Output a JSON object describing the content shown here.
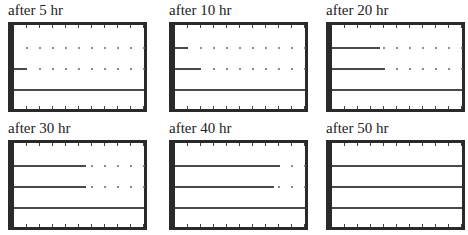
{
  "figure": {
    "grid": {
      "columns": 10,
      "rows": [
        0.27,
        0.52,
        0.77
      ]
    },
    "panels": [
      {
        "label": "after 5 hr",
        "x": 8,
        "y": 2,
        "lines": [
          0,
          1.0,
          10
        ]
      },
      {
        "label": "after 10 hr",
        "x": 169,
        "y": 2,
        "lines": [
          1.0,
          2.0,
          10
        ]
      },
      {
        "label": "after 20 hr",
        "x": 326,
        "y": 2,
        "lines": [
          3.7,
          4.1,
          10
        ]
      },
      {
        "label": "after 30 hr",
        "x": 8,
        "y": 120,
        "lines": [
          5.5,
          5.5,
          10
        ]
      },
      {
        "label": "after 40 hr",
        "x": 169,
        "y": 120,
        "lines": [
          8.1,
          7.6,
          10
        ]
      },
      {
        "label": "after 50 hr",
        "x": 326,
        "y": 120,
        "lines": [
          10,
          10,
          10
        ]
      }
    ],
    "colors": {
      "frame": "#2a2a2a",
      "line": "#4a4a4a",
      "dot": "#666666"
    }
  }
}
